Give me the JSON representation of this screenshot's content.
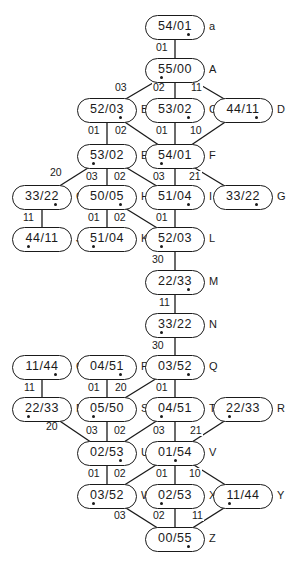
{
  "nodes": [
    {
      "id": "a",
      "value": "54/01",
      "tag": "a",
      "x": 175,
      "y": 27,
      "dot": "right"
    },
    {
      "id": "A",
      "value": "55/00",
      "tag": "A",
      "x": 175,
      "y": 70,
      "dot": "left"
    },
    {
      "id": "B",
      "value": "52/03",
      "tag": "B",
      "x": 107,
      "y": 110,
      "dot": "right"
    },
    {
      "id": "C",
      "value": "53/02",
      "tag": "C",
      "x": 175,
      "y": 110,
      "dot": "right"
    },
    {
      "id": "D",
      "value": "44/11",
      "tag": "D",
      "x": 243,
      "y": 110,
      "dot": "right"
    },
    {
      "id": "E",
      "value": "53/02",
      "tag": "E",
      "x": 107,
      "y": 156,
      "dot": "left"
    },
    {
      "id": "F",
      "value": "54/01",
      "tag": "F",
      "x": 175,
      "y": 156,
      "dot": "left"
    },
    {
      "id": "G1",
      "value": "33/22",
      "tag": "G",
      "x": 42,
      "y": 197,
      "dot": "right"
    },
    {
      "id": "H",
      "value": "50/05",
      "tag": "H",
      "x": 107,
      "y": 197,
      "dot": "right"
    },
    {
      "id": "I",
      "value": "51/04",
      "tag": "I",
      "x": 175,
      "y": 197,
      "dot": "right"
    },
    {
      "id": "G2",
      "value": "33/22",
      "tag": "G",
      "x": 243,
      "y": 197,
      "dot": "right"
    },
    {
      "id": "J",
      "value": "44/11",
      "tag": "J",
      "x": 42,
      "y": 239,
      "dot": "left"
    },
    {
      "id": "K",
      "value": "51/04",
      "tag": "K",
      "x": 107,
      "y": 239,
      "dot": "left"
    },
    {
      "id": "L",
      "value": "52/03",
      "tag": "L",
      "x": 175,
      "y": 239,
      "dot": "left"
    },
    {
      "id": "M",
      "value": "22/33",
      "tag": "M",
      "x": 175,
      "y": 282,
      "dot": "right"
    },
    {
      "id": "N",
      "value": "33/22",
      "tag": "N",
      "x": 175,
      "y": 325,
      "dot": "left"
    },
    {
      "id": "O",
      "value": "11/44",
      "tag": "O",
      "x": 42,
      "y": 367,
      "dot": "right"
    },
    {
      "id": "P",
      "value": "04/51",
      "tag": "P",
      "x": 107,
      "y": 367,
      "dot": "right"
    },
    {
      "id": "Q",
      "value": "03/52",
      "tag": "Q",
      "x": 175,
      "y": 367,
      "dot": "right"
    },
    {
      "id": "R1",
      "value": "22/33",
      "tag": "R",
      "x": 42,
      "y": 409,
      "dot": "left"
    },
    {
      "id": "S",
      "value": "05/50",
      "tag": "S",
      "x": 107,
      "y": 409,
      "dot": "left"
    },
    {
      "id": "T",
      "value": "04/51",
      "tag": "T",
      "x": 175,
      "y": 409,
      "dot": "left"
    },
    {
      "id": "R2",
      "value": "22/33",
      "tag": "R",
      "x": 243,
      "y": 409,
      "dot": "left"
    },
    {
      "id": "U",
      "value": "02/53",
      "tag": "U",
      "x": 107,
      "y": 453,
      "dot": "right"
    },
    {
      "id": "V",
      "value": "01/54",
      "tag": "V",
      "x": 175,
      "y": 453,
      "dot": "mid"
    },
    {
      "id": "W",
      "value": "03/52",
      "tag": "W",
      "x": 107,
      "y": 496,
      "dot": "left"
    },
    {
      "id": "X",
      "value": "02/53",
      "tag": "X",
      "x": 175,
      "y": 496,
      "dot": "left"
    },
    {
      "id": "Y",
      "value": "11/44",
      "tag": "Y",
      "x": 243,
      "y": 496,
      "dot": "left"
    },
    {
      "id": "Z",
      "value": "00/55",
      "tag": "Z",
      "x": 175,
      "y": 539,
      "dot": "right"
    }
  ],
  "edges": [
    {
      "from": "a",
      "to": "A",
      "label": "01",
      "lx": 162,
      "ly": 48,
      "side": "left"
    },
    {
      "from": "A",
      "to": "B",
      "label": "03",
      "lx": 121,
      "ly": 88,
      "side": "left"
    },
    {
      "from": "A",
      "to": "C",
      "label": "02",
      "lx": 159,
      "ly": 88,
      "side": "left"
    },
    {
      "from": "A",
      "to": "D",
      "label": "11",
      "lx": 197,
      "ly": 88,
      "side": "right"
    },
    {
      "from": "B",
      "to": "E",
      "label": "01",
      "lx": 94,
      "ly": 131,
      "side": "left"
    },
    {
      "from": "B",
      "to": "F",
      "label": "02",
      "lx": 121,
      "ly": 131,
      "side": "right"
    },
    {
      "from": "C",
      "to": "F",
      "label": "01",
      "lx": 162,
      "ly": 131,
      "side": "left"
    },
    {
      "from": "D",
      "to": "F",
      "label": "10",
      "lx": 196,
      "ly": 131,
      "side": "right"
    },
    {
      "from": "E",
      "to": "G1",
      "label": "20",
      "lx": 56,
      "ly": 173,
      "side": "left"
    },
    {
      "from": "E",
      "to": "H",
      "label": "03",
      "lx": 92,
      "ly": 177,
      "side": "left"
    },
    {
      "from": "E",
      "to": "I",
      "label": "02",
      "lx": 120,
      "ly": 177,
      "side": "right"
    },
    {
      "from": "F",
      "to": "I",
      "label": "03",
      "lx": 159,
      "ly": 177,
      "side": "left"
    },
    {
      "from": "F",
      "to": "G2",
      "label": "21",
      "lx": 195,
      "ly": 177,
      "side": "right"
    },
    {
      "from": "G1",
      "to": "J",
      "label": "11",
      "lx": 29,
      "ly": 218,
      "side": "left"
    },
    {
      "from": "H",
      "to": "K",
      "label": "01",
      "lx": 94,
      "ly": 218,
      "side": "left"
    },
    {
      "from": "H",
      "to": "L",
      "label": "02",
      "lx": 120,
      "ly": 218,
      "side": "right"
    },
    {
      "from": "I",
      "to": "L",
      "label": "01",
      "lx": 162,
      "ly": 218,
      "side": "left"
    },
    {
      "from": "L",
      "to": "M",
      "label": "30",
      "lx": 158,
      "ly": 260,
      "side": "left"
    },
    {
      "from": "M",
      "to": "N",
      "label": "11",
      "lx": 165,
      "ly": 303,
      "side": "left"
    },
    {
      "from": "N",
      "to": "Q",
      "label": "30",
      "lx": 158,
      "ly": 346,
      "side": "left"
    },
    {
      "from": "O",
      "to": "R1",
      "label": "11",
      "lx": 30,
      "ly": 388,
      "side": "left"
    },
    {
      "from": "P",
      "to": "S",
      "label": "01",
      "lx": 94,
      "ly": 388,
      "side": "left"
    },
    {
      "from": "Q",
      "to": "S",
      "label": "20",
      "lx": 121,
      "ly": 388,
      "side": "right"
    },
    {
      "from": "Q",
      "to": "T",
      "label": "01",
      "lx": 162,
      "ly": 388,
      "side": "left"
    },
    {
      "from": "R1",
      "to": "U",
      "label": "20",
      "lx": 52,
      "ly": 427,
      "side": "left"
    },
    {
      "from": "S",
      "to": "U",
      "label": "03",
      "lx": 92,
      "ly": 431,
      "side": "left"
    },
    {
      "from": "T",
      "to": "U",
      "label": "02",
      "lx": 120,
      "ly": 431,
      "side": "right"
    },
    {
      "from": "T",
      "to": "V",
      "label": "03",
      "lx": 159,
      "ly": 431,
      "side": "left"
    },
    {
      "from": "R2",
      "to": "V",
      "label": "21",
      "lx": 196,
      "ly": 431,
      "side": "right"
    },
    {
      "from": "U",
      "to": "W",
      "label": "01",
      "lx": 94,
      "ly": 474,
      "side": "left"
    },
    {
      "from": "V",
      "to": "W",
      "label": "02",
      "lx": 120,
      "ly": 474,
      "side": "right"
    },
    {
      "from": "V",
      "to": "X",
      "label": "01",
      "lx": 162,
      "ly": 474,
      "side": "left"
    },
    {
      "from": "V",
      "to": "Y",
      "label": "10",
      "lx": 195,
      "ly": 474,
      "side": "right"
    },
    {
      "from": "W",
      "to": "Z",
      "label": "03",
      "lx": 120,
      "ly": 516,
      "side": "left"
    },
    {
      "from": "X",
      "to": "Z",
      "label": "02",
      "lx": 159,
      "ly": 516,
      "side": "left"
    },
    {
      "from": "Y",
      "to": "Z",
      "label": "11",
      "lx": 198,
      "ly": 516,
      "side": "right"
    }
  ]
}
